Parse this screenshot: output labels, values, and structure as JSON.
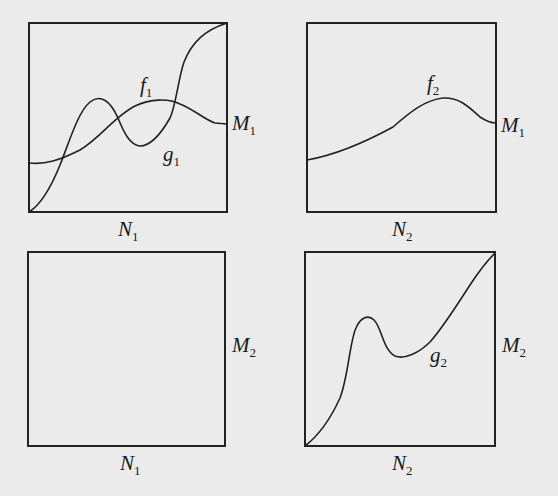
{
  "figure": {
    "panels": [
      {
        "id": "top-left",
        "box": {
          "x": 29,
          "y": 23,
          "w": 198,
          "h": 189
        },
        "bottom_label": {
          "main": "N",
          "sub": "1"
        },
        "right_label": {
          "main": "M",
          "sub": "1"
        },
        "curves": [
          {
            "name": "f",
            "sub": "1",
            "label_pos": [
              140,
              92
            ]
          },
          {
            "name": "g",
            "sub": "1",
            "label_pos": [
              163,
              161
            ]
          }
        ]
      },
      {
        "id": "top-right",
        "box": {
          "x": 307,
          "y": 23,
          "w": 189,
          "h": 189
        },
        "bottom_label": {
          "main": "N",
          "sub": "2"
        },
        "right_label": {
          "main": "M",
          "sub": "1"
        },
        "curves": [
          {
            "name": "f",
            "sub": "2",
            "label_pos": [
              427,
              90
            ]
          }
        ]
      },
      {
        "id": "bottom-left",
        "box": {
          "x": 28,
          "y": 252,
          "w": 197,
          "h": 194
        },
        "bottom_label": {
          "main": "N",
          "sub": "1"
        },
        "right_label": {
          "main": "M",
          "sub": "2"
        },
        "curves": []
      },
      {
        "id": "bottom-right",
        "box": {
          "x": 305,
          "y": 252,
          "w": 190,
          "h": 194
        },
        "bottom_label": {
          "main": "N",
          "sub": "2"
        },
        "right_label": {
          "main": "M",
          "sub": "2"
        },
        "curves": [
          {
            "name": "g",
            "sub": "2",
            "label_pos": [
              430,
              362
            ]
          }
        ]
      }
    ],
    "labels": {
      "tl_f": "f",
      "tl_f_sub": "1",
      "tl_g": "g",
      "tl_g_sub": "1",
      "tl_M": "M",
      "tl_M_sub": "1",
      "tl_N": "N",
      "tl_N_sub": "1",
      "tr_f": "f",
      "tr_f_sub": "2",
      "tr_M": "M",
      "tr_M_sub": "1",
      "tr_N": "N",
      "tr_N_sub": "2",
      "bl_M": "M",
      "bl_M_sub": "2",
      "bl_N": "N",
      "bl_N_sub": "1",
      "br_g": "g",
      "br_g_sub": "2",
      "br_M": "M",
      "br_M_sub": "2",
      "br_N": "N",
      "br_N_sub": "2"
    },
    "colors": {
      "ink": "#222222",
      "paper": "#ebebeb",
      "bleed_text": "#d6d6d6"
    }
  }
}
